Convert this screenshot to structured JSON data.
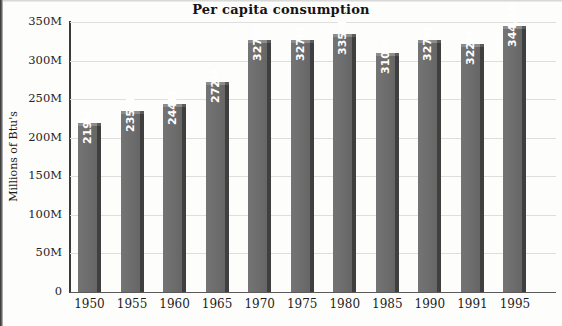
{
  "chart_data": {
    "type": "bar",
    "title": "Per capita consumption",
    "xlabel": "",
    "ylabel": "Millions of Btu's",
    "categories": [
      "1950",
      "1955",
      "1960",
      "1965",
      "1970",
      "1975",
      "1980",
      "1985",
      "1990",
      "1991",
      "1995"
    ],
    "values": [
      219,
      235,
      244,
      272,
      327,
      327,
      335,
      310,
      327,
      322,
      344.4
    ],
    "data_labels": [
      "219M",
      "235M",
      "244M",
      "272M",
      "327M",
      "327M",
      "335M",
      "310M",
      "327M",
      "322M",
      "344.4M"
    ],
    "ylim": [
      0,
      350
    ],
    "yticks": [
      0,
      50,
      100,
      150,
      200,
      250,
      300,
      350
    ],
    "ytick_labels": [
      "0",
      "50M",
      "100M",
      "150M",
      "200M",
      "250M",
      "300M",
      "350M"
    ],
    "grid": true,
    "legend": "none",
    "bar_color": "#6f6f6f",
    "bar_side_color": "#3f3f3f",
    "bar_top_color": "#8c8c8c",
    "data_label_color": "#ffffff",
    "gridline_color": "#dedede",
    "axis_color": "#3b3b3b",
    "background_color": "#fdfdfc",
    "style": "3d-column"
  }
}
